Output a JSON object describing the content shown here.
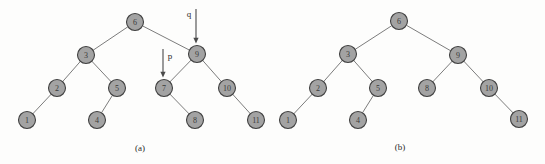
{
  "figure": {
    "background_color": "#fdfdfc",
    "node_fill_color": "#a3a3a3",
    "node_stroke_color": "#404040",
    "edge_color": "#6d6d6d",
    "pointer_color": "#4a4a4a"
  },
  "chart_data": {
    "type": "diagram",
    "title": "",
    "subtitle": "",
    "xlabel": "",
    "ylabel": "",
    "grid": false,
    "legend": "none",
    "panels": [
      {
        "id": "a",
        "caption": "(a)",
        "caption_x": 140,
        "caption_y": 148,
        "nodes": [
          {
            "label": "6",
            "x": 135,
            "y": 22,
            "r": 8.5
          },
          {
            "label": "3",
            "x": 86,
            "y": 55,
            "r": 8.5
          },
          {
            "label": "9",
            "x": 197,
            "y": 54,
            "r": 8.5
          },
          {
            "label": "2",
            "x": 57,
            "y": 88,
            "r": 8.5
          },
          {
            "label": "5",
            "x": 117,
            "y": 88,
            "r": 8.5
          },
          {
            "label": "7",
            "x": 164,
            "y": 88,
            "r": 8.5
          },
          {
            "label": "10",
            "x": 227,
            "y": 88,
            "r": 8.5
          },
          {
            "label": "1",
            "x": 27,
            "y": 120,
            "r": 8.5
          },
          {
            "label": "4",
            "x": 97,
            "y": 120,
            "r": 8.5
          },
          {
            "label": "8",
            "x": 195,
            "y": 120,
            "r": 8.5
          },
          {
            "label": "11",
            "x": 256,
            "y": 120,
            "r": 8.5
          }
        ],
        "edges": [
          [
            "6",
            "3"
          ],
          [
            "6",
            "9"
          ],
          [
            "3",
            "2"
          ],
          [
            "3",
            "5"
          ],
          [
            "9",
            "7"
          ],
          [
            "9",
            "10"
          ],
          [
            "2",
            "1"
          ],
          [
            "5",
            "4"
          ],
          [
            "7",
            "8"
          ],
          [
            "10",
            "11"
          ]
        ],
        "pointers": [
          {
            "label": "q",
            "label_x": 189,
            "label_y": 14,
            "shaft_x": 196,
            "shaft_y1": 9,
            "shaft_y2": 41
          },
          {
            "label": "p",
            "label_x": 170,
            "label_y": 56,
            "shaft_x": 163,
            "shaft_y1": 49,
            "shaft_y2": 75
          }
        ]
      },
      {
        "id": "b",
        "caption": "(b)",
        "caption_x": 400,
        "caption_y": 147,
        "nodes": [
          {
            "label": "6",
            "x": 399,
            "y": 21,
            "r": 8.5
          },
          {
            "label": "3",
            "x": 348,
            "y": 54,
            "r": 8.5
          },
          {
            "label": "9",
            "x": 458,
            "y": 55,
            "r": 8.5
          },
          {
            "label": "2",
            "x": 318,
            "y": 88,
            "r": 8.5
          },
          {
            "label": "5",
            "x": 378,
            "y": 88,
            "r": 8.5
          },
          {
            "label": "8",
            "x": 427,
            "y": 88,
            "r": 8.5
          },
          {
            "label": "10",
            "x": 489,
            "y": 88,
            "r": 8.5
          },
          {
            "label": "1",
            "x": 288,
            "y": 120,
            "r": 8.5
          },
          {
            "label": "4",
            "x": 358,
            "y": 120,
            "r": 8.5
          },
          {
            "label": "11",
            "x": 519,
            "y": 119,
            "r": 8.5
          }
        ],
        "edges": [
          [
            "6",
            "3"
          ],
          [
            "6",
            "9"
          ],
          [
            "3",
            "2"
          ],
          [
            "3",
            "5"
          ],
          [
            "9",
            "8"
          ],
          [
            "9",
            "10"
          ],
          [
            "2",
            "1"
          ],
          [
            "5",
            "4"
          ],
          [
            "10",
            "11"
          ]
        ],
        "pointers": []
      }
    ]
  }
}
